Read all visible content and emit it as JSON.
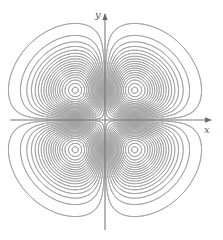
{
  "figure": {
    "type": "contour-plot",
    "width": 223,
    "height": 240
  },
  "axes": {
    "x_label": "x",
    "y_label": "y",
    "origin_px": [
      105,
      120
    ],
    "x_axis_px": {
      "start": 10,
      "end": 211
    },
    "y_axis_px": {
      "start": 14,
      "end": 230
    },
    "axis_color": "#777777",
    "arrowheads": true
  },
  "contours": {
    "function": "x*y*exp(-(x^2+y^2))",
    "scale_px_per_unit": 42,
    "domain": {
      "x": [
        -2.6,
        2.6
      ],
      "y": [
        -2.8,
        2.8
      ]
    },
    "levels_abs": [
      0.005,
      0.015,
      0.025,
      0.035,
      0.045,
      0.055,
      0.065,
      0.075,
      0.085,
      0.095,
      0.105,
      0.115,
      0.125,
      0.135,
      0.145,
      0.155,
      0.165,
      0.175,
      0.182
    ],
    "line_color": "#9a9a9a",
    "line_width": 0.8,
    "lobe_centers_px": [
      [
        74,
        89
      ],
      [
        135,
        89
      ],
      [
        74,
        151
      ],
      [
        135,
        151
      ]
    ]
  }
}
